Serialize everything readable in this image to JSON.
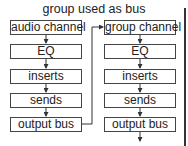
{
  "title": "group used as bus",
  "left_chain": [
    "audio channel",
    "EQ",
    "inserts",
    "sends",
    "output bus"
  ],
  "right_chain": [
    "group channel",
    "EQ",
    "inserts",
    "sends",
    "output bus"
  ]
}
